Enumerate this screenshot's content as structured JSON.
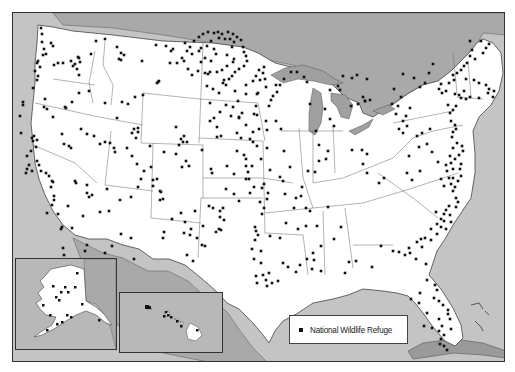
{
  "map": {
    "title": "National Wildlife Refuges of the United States",
    "colors": {
      "land_us": "#ffffff",
      "land_foreign": "#a9a9a9",
      "water": "#c4c4c4",
      "lakes": "#a0a0a0",
      "borders": "#555555",
      "marker": "#111111",
      "frame": "#333333"
    },
    "insets": [
      {
        "name": "Alaska"
      },
      {
        "name": "Hawaii"
      }
    ]
  },
  "legend": {
    "items": [
      {
        "symbol": "black-square",
        "label": "National Wildlife Refuge"
      }
    ]
  },
  "refuges_mainland": [
    [
      40,
      27
    ],
    [
      41,
      33
    ],
    [
      41,
      41
    ],
    [
      43,
      48
    ],
    [
      42,
      54
    ],
    [
      45,
      53
    ],
    [
      50,
      42
    ],
    [
      52,
      45
    ],
    [
      37,
      60
    ],
    [
      39,
      66
    ],
    [
      34,
      70
    ],
    [
      37,
      75
    ],
    [
      36,
      79
    ],
    [
      32,
      87
    ],
    [
      36,
      62
    ],
    [
      53,
      64
    ],
    [
      57,
      62
    ],
    [
      62,
      62
    ],
    [
      70,
      60
    ],
    [
      74,
      63
    ],
    [
      77,
      56
    ],
    [
      79,
      61
    ],
    [
      78,
      57
    ],
    [
      72,
      65
    ],
    [
      76,
      68
    ],
    [
      78,
      74
    ],
    [
      95,
      40
    ],
    [
      90,
      53
    ],
    [
      104,
      38
    ],
    [
      116,
      46
    ],
    [
      120,
      52
    ],
    [
      118,
      58
    ],
    [
      123,
      54
    ],
    [
      120,
      59
    ],
    [
      141,
      60
    ],
    [
      155,
      44
    ],
    [
      165,
      45
    ],
    [
      170,
      50
    ],
    [
      172,
      48
    ],
    [
      176,
      62
    ],
    [
      169,
      62
    ],
    [
      157,
      81
    ],
    [
      158,
      80
    ],
    [
      156,
      82
    ],
    [
      142,
      94
    ],
    [
      134,
      96
    ],
    [
      121,
      101
    ],
    [
      116,
      117
    ],
    [
      104,
      102
    ],
    [
      127,
      103
    ],
    [
      22,
      101
    ],
    [
      22,
      104
    ],
    [
      19,
      115
    ],
    [
      44,
      98
    ],
    [
      43,
      106
    ],
    [
      46,
      108
    ],
    [
      52,
      116
    ],
    [
      65,
      107
    ],
    [
      71,
      101
    ],
    [
      64,
      106
    ],
    [
      78,
      92
    ],
    [
      88,
      90
    ],
    [
      20,
      132
    ],
    [
      33,
      135
    ],
    [
      31,
      137
    ],
    [
      36,
      139
    ],
    [
      32,
      140
    ],
    [
      35,
      146
    ],
    [
      30,
      150
    ],
    [
      26,
      155
    ],
    [
      36,
      160
    ],
    [
      38,
      164
    ],
    [
      28,
      164
    ],
    [
      26,
      168
    ],
    [
      31,
      170
    ],
    [
      25,
      172
    ],
    [
      40,
      170
    ],
    [
      48,
      175
    ],
    [
      45,
      172
    ],
    [
      51,
      180
    ],
    [
      52,
      181
    ],
    [
      61,
      133
    ],
    [
      63,
      143
    ],
    [
      68,
      145
    ],
    [
      70,
      147
    ],
    [
      99,
      143
    ],
    [
      114,
      151
    ],
    [
      126,
      147
    ],
    [
      135,
      137
    ],
    [
      131,
      132
    ],
    [
      133,
      128
    ],
    [
      137,
      127
    ],
    [
      137,
      131
    ],
    [
      149,
      145
    ],
    [
      163,
      151
    ],
    [
      175,
      126
    ],
    [
      182,
      141
    ],
    [
      178,
      144
    ],
    [
      186,
      141
    ],
    [
      180,
      138
    ],
    [
      183,
      135
    ],
    [
      201,
      149
    ],
    [
      210,
      168
    ],
    [
      211,
      172
    ],
    [
      185,
      160
    ],
    [
      188,
      165
    ],
    [
      181,
      166
    ],
    [
      175,
      153
    ],
    [
      150,
      166
    ],
    [
      152,
      179
    ],
    [
      159,
      190
    ],
    [
      137,
      186
    ],
    [
      130,
      196
    ],
    [
      108,
      210
    ],
    [
      119,
      199
    ],
    [
      106,
      188
    ],
    [
      88,
      196
    ],
    [
      86,
      184
    ],
    [
      86,
      192
    ],
    [
      91,
      194
    ],
    [
      75,
      182
    ],
    [
      74,
      180
    ],
    [
      50,
      186
    ],
    [
      53,
      195
    ],
    [
      53,
      199
    ],
    [
      51,
      204
    ],
    [
      46,
      212
    ],
    [
      57,
      213
    ],
    [
      67,
      205
    ],
    [
      82,
      215
    ],
    [
      99,
      211
    ],
    [
      111,
      245
    ],
    [
      120,
      233
    ],
    [
      86,
      244
    ],
    [
      84,
      250
    ],
    [
      61,
      226
    ],
    [
      60,
      228
    ],
    [
      71,
      227
    ],
    [
      62,
      247
    ],
    [
      63,
      254
    ],
    [
      79,
      265
    ],
    [
      104,
      252
    ],
    [
      130,
      237
    ],
    [
      133,
      258
    ],
    [
      160,
      191
    ],
    [
      162,
      198
    ],
    [
      163,
      231
    ],
    [
      162,
      237
    ],
    [
      184,
      221
    ],
    [
      183,
      232
    ],
    [
      190,
      228
    ],
    [
      201,
      244
    ],
    [
      186,
      254
    ],
    [
      192,
      260
    ],
    [
      204,
      245
    ],
    [
      220,
      229
    ],
    [
      223,
      219
    ],
    [
      212,
      207
    ],
    [
      208,
      205
    ],
    [
      226,
      165
    ],
    [
      245,
      165
    ],
    [
      240,
      137
    ],
    [
      216,
      126
    ],
    [
      216,
      136
    ],
    [
      220,
      135
    ],
    [
      236,
      132
    ],
    [
      245,
      124
    ],
    [
      238,
      116
    ],
    [
      256,
      114
    ],
    [
      253,
      113
    ],
    [
      255,
      105
    ],
    [
      256,
      93
    ],
    [
      275,
      84
    ],
    [
      276,
      91
    ],
    [
      270,
      99
    ],
    [
      268,
      105
    ],
    [
      258,
      128
    ],
    [
      252,
      131
    ],
    [
      266,
      129
    ],
    [
      265,
      120
    ],
    [
      275,
      120
    ],
    [
      280,
      128
    ],
    [
      256,
      145
    ],
    [
      233,
      173
    ],
    [
      247,
      171
    ],
    [
      245,
      178
    ],
    [
      269,
      169
    ],
    [
      260,
      158
    ],
    [
      266,
      147
    ],
    [
      283,
      150
    ],
    [
      282,
      180
    ],
    [
      267,
      192
    ],
    [
      284,
      193
    ],
    [
      295,
      197
    ],
    [
      300,
      195
    ],
    [
      301,
      186
    ],
    [
      293,
      207
    ],
    [
      309,
      210
    ],
    [
      285,
      222
    ],
    [
      305,
      207
    ],
    [
      297,
      228
    ],
    [
      316,
      225
    ],
    [
      327,
      206
    ],
    [
      340,
      226
    ],
    [
      333,
      238
    ],
    [
      320,
      245
    ],
    [
      312,
      252
    ],
    [
      306,
      258
    ],
    [
      299,
      264
    ],
    [
      295,
      271
    ],
    [
      287,
      266
    ],
    [
      282,
      262
    ],
    [
      277,
      280
    ],
    [
      271,
      282
    ],
    [
      266,
      285
    ],
    [
      265,
      279
    ],
    [
      268,
      272
    ],
    [
      262,
      274
    ],
    [
      256,
      282
    ],
    [
      255,
      275
    ],
    [
      260,
      262
    ],
    [
      253,
      258
    ],
    [
      251,
      248
    ],
    [
      260,
      250
    ],
    [
      254,
      239
    ],
    [
      255,
      230
    ],
    [
      261,
      213
    ],
    [
      263,
      207
    ],
    [
      259,
      201
    ],
    [
      266,
      198
    ],
    [
      261,
      187
    ],
    [
      263,
      183
    ],
    [
      279,
      176
    ],
    [
      289,
      166
    ],
    [
      279,
      237
    ],
    [
      269,
      235
    ],
    [
      257,
      234
    ],
    [
      254,
      226
    ],
    [
      305,
      225
    ],
    [
      313,
      259
    ],
    [
      311,
      268
    ],
    [
      320,
      270
    ],
    [
      344,
      272
    ],
    [
      348,
      261
    ],
    [
      355,
      260
    ],
    [
      371,
      266
    ],
    [
      380,
      245
    ],
    [
      392,
      250
    ],
    [
      398,
      251
    ],
    [
      404,
      254
    ],
    [
      408,
      247
    ],
    [
      409,
      252
    ],
    [
      415,
      258
    ],
    [
      425,
      263
    ],
    [
      426,
      279
    ],
    [
      434,
      284
    ],
    [
      436,
      289
    ],
    [
      433,
      297
    ],
    [
      438,
      300
    ],
    [
      442,
      304
    ],
    [
      447,
      309
    ],
    [
      447,
      313
    ],
    [
      449,
      318
    ],
    [
      438,
      318
    ],
    [
      441,
      325
    ],
    [
      450,
      328
    ],
    [
      438,
      330
    ],
    [
      419,
      292
    ],
    [
      426,
      312
    ],
    [
      423,
      325
    ],
    [
      431,
      327
    ],
    [
      439,
      343
    ],
    [
      443,
      345
    ],
    [
      446,
      349
    ],
    [
      410,
      298
    ],
    [
      418,
      302
    ],
    [
      440,
      338
    ],
    [
      443,
      334
    ],
    [
      416,
      241
    ],
    [
      420,
      238
    ],
    [
      424,
      237
    ],
    [
      430,
      228
    ],
    [
      436,
      223
    ],
    [
      440,
      218
    ],
    [
      443,
      213
    ],
    [
      445,
      209
    ],
    [
      448,
      205
    ],
    [
      435,
      211
    ],
    [
      443,
      220
    ],
    [
      440,
      226
    ],
    [
      421,
      246
    ],
    [
      430,
      239
    ],
    [
      436,
      233
    ],
    [
      445,
      228
    ],
    [
      450,
      221
    ],
    [
      449,
      214
    ],
    [
      455,
      206
    ],
    [
      457,
      201
    ],
    [
      455,
      197
    ],
    [
      452,
      190
    ],
    [
      454,
      186
    ],
    [
      457,
      180
    ],
    [
      460,
      175
    ],
    [
      459,
      168
    ],
    [
      452,
      168
    ],
    [
      460,
      163
    ],
    [
      454,
      158
    ],
    [
      458,
      154
    ],
    [
      462,
      150
    ],
    [
      461,
      145
    ],
    [
      456,
      142
    ],
    [
      452,
      147
    ],
    [
      449,
      155
    ],
    [
      450,
      162
    ],
    [
      446,
      170
    ],
    [
      448,
      177
    ],
    [
      452,
      177
    ],
    [
      450,
      183
    ],
    [
      443,
      185
    ],
    [
      440,
      178
    ],
    [
      445,
      164
    ],
    [
      451,
      136
    ],
    [
      452,
      131
    ],
    [
      455,
      128
    ],
    [
      454,
      124
    ],
    [
      450,
      120
    ],
    [
      449,
      112
    ],
    [
      447,
      104
    ],
    [
      452,
      109
    ],
    [
      455,
      105
    ],
    [
      460,
      97
    ],
    [
      458,
      94
    ],
    [
      465,
      98
    ],
    [
      469,
      96
    ],
    [
      463,
      90
    ],
    [
      454,
      93
    ],
    [
      445,
      90
    ],
    [
      441,
      92
    ],
    [
      438,
      88
    ],
    [
      440,
      83
    ],
    [
      448,
      82
    ],
    [
      453,
      79
    ],
    [
      452,
      74
    ],
    [
      456,
      72
    ],
    [
      460,
      69
    ],
    [
      466,
      62
    ],
    [
      469,
      55
    ],
    [
      471,
      49
    ],
    [
      469,
      40
    ],
    [
      480,
      40
    ],
    [
      488,
      43
    ],
    [
      485,
      47
    ],
    [
      482,
      52
    ],
    [
      474,
      58
    ],
    [
      463,
      65
    ],
    [
      465,
      78
    ],
    [
      473,
      79
    ],
    [
      478,
      82
    ],
    [
      485,
      84
    ],
    [
      488,
      88
    ],
    [
      493,
      90
    ],
    [
      492,
      96
    ],
    [
      487,
      92
    ],
    [
      478,
      97
    ],
    [
      432,
      63
    ],
    [
      428,
      72
    ],
    [
      424,
      82
    ],
    [
      419,
      86
    ],
    [
      413,
      77
    ],
    [
      402,
      73
    ],
    [
      393,
      88
    ],
    [
      400,
      96
    ],
    [
      397,
      105
    ],
    [
      405,
      115
    ],
    [
      406,
      125
    ],
    [
      402,
      132
    ],
    [
      398,
      128
    ],
    [
      402,
      120
    ],
    [
      409,
      107
    ],
    [
      395,
      113
    ],
    [
      391,
      103
    ],
    [
      350,
      105
    ],
    [
      357,
      103
    ],
    [
      362,
      96
    ],
    [
      364,
      100
    ],
    [
      369,
      99
    ],
    [
      351,
      77
    ],
    [
      356,
      74
    ],
    [
      366,
      78
    ],
    [
      364,
      100
    ],
    [
      342,
      75
    ],
    [
      337,
      85
    ],
    [
      339,
      89
    ],
    [
      329,
      89
    ],
    [
      324,
      108
    ],
    [
      329,
      118
    ],
    [
      333,
      125
    ],
    [
      327,
      150
    ],
    [
      325,
      158
    ],
    [
      318,
      160
    ],
    [
      314,
      171
    ],
    [
      307,
      170
    ],
    [
      318,
      144
    ],
    [
      315,
      130
    ],
    [
      309,
      103
    ],
    [
      306,
      81
    ],
    [
      303,
      76
    ],
    [
      296,
      71
    ],
    [
      290,
      71
    ],
    [
      283,
      78
    ],
    [
      279,
      84
    ],
    [
      272,
      95
    ],
    [
      265,
      86
    ],
    [
      264,
      78
    ],
    [
      262,
      72
    ],
    [
      258,
      69
    ],
    [
      263,
      66
    ],
    [
      257,
      92
    ],
    [
      351,
      149
    ],
    [
      361,
      149
    ],
    [
      366,
      153
    ],
    [
      362,
      163
    ],
    [
      366,
      172
    ],
    [
      383,
      177
    ],
    [
      378,
      182
    ],
    [
      406,
      172
    ],
    [
      411,
      179
    ],
    [
      419,
      170
    ],
    [
      408,
      155
    ],
    [
      418,
      146
    ],
    [
      416,
      135
    ],
    [
      421,
      132
    ],
    [
      429,
      128
    ],
    [
      426,
      143
    ],
    [
      431,
      151
    ],
    [
      437,
      161
    ],
    [
      222,
      82
    ],
    [
      223,
      79
    ],
    [
      218,
      92
    ],
    [
      212,
      88
    ],
    [
      209,
      102
    ],
    [
      206,
      85
    ],
    [
      207,
      73
    ],
    [
      204,
      72
    ],
    [
      209,
      71
    ],
    [
      216,
      71
    ],
    [
      221,
      69
    ],
    [
      226,
      65
    ],
    [
      232,
      61
    ],
    [
      233,
      58
    ],
    [
      226,
      54
    ],
    [
      231,
      46
    ],
    [
      233,
      41
    ],
    [
      229,
      38
    ],
    [
      224,
      38
    ],
    [
      218,
      37
    ],
    [
      210,
      40
    ],
    [
      206,
      45
    ],
    [
      204,
      57
    ],
    [
      210,
      60
    ],
    [
      215,
      53
    ],
    [
      213,
      48
    ],
    [
      200,
      47
    ],
    [
      198,
      50
    ],
    [
      200,
      61
    ],
    [
      197,
      70
    ],
    [
      191,
      74
    ],
    [
      187,
      68
    ],
    [
      183,
      60
    ],
    [
      181,
      57
    ],
    [
      186,
      50
    ],
    [
      191,
      53
    ],
    [
      189,
      46
    ],
    [
      184,
      42
    ],
    [
      193,
      40
    ],
    [
      198,
      36
    ],
    [
      202,
      33
    ],
    [
      207,
      31
    ],
    [
      213,
      32
    ],
    [
      217,
      31
    ],
    [
      221,
      33
    ],
    [
      227,
      31
    ],
    [
      232,
      33
    ],
    [
      236,
      36
    ],
    [
      240,
      39
    ],
    [
      242,
      46
    ],
    [
      243,
      51
    ],
    [
      245,
      55
    ],
    [
      246,
      60
    ],
    [
      243,
      65
    ],
    [
      238,
      68
    ],
    [
      234,
      71
    ],
    [
      231,
      75
    ],
    [
      228,
      78
    ],
    [
      225,
      84
    ],
    [
      234,
      90
    ],
    [
      245,
      84
    ],
    [
      252,
      80
    ],
    [
      259,
      79
    ],
    [
      255,
      75
    ],
    [
      245,
      93
    ],
    [
      237,
      100
    ],
    [
      232,
      106
    ],
    [
      225,
      104
    ],
    [
      219,
      111
    ],
    [
      230,
      115
    ],
    [
      241,
      112
    ],
    [
      238,
      117
    ],
    [
      213,
      117
    ],
    [
      209,
      120
    ],
    [
      236,
      150
    ],
    [
      243,
      154
    ],
    [
      249,
      138
    ],
    [
      252,
      141
    ],
    [
      245,
      158
    ],
    [
      251,
      165
    ],
    [
      248,
      178
    ],
    [
      253,
      186
    ],
    [
      249,
      192
    ],
    [
      238,
      200
    ],
    [
      225,
      188
    ],
    [
      233,
      193
    ],
    [
      219,
      210
    ],
    [
      222,
      207
    ],
    [
      219,
      216
    ],
    [
      218,
      228
    ],
    [
      215,
      231
    ],
    [
      202,
      225
    ],
    [
      196,
      237
    ],
    [
      189,
      234
    ],
    [
      171,
      218
    ],
    [
      180,
      212
    ],
    [
      194,
      210
    ],
    [
      159,
      199
    ],
    [
      152,
      185
    ],
    [
      156,
      178
    ],
    [
      143,
      170
    ],
    [
      140,
      178
    ],
    [
      136,
      163
    ],
    [
      131,
      155
    ],
    [
      113,
      147
    ],
    [
      109,
      142
    ],
    [
      104,
      141
    ],
    [
      93,
      135
    ],
    [
      86,
      133
    ],
    [
      80,
      128
    ]
  ]
}
